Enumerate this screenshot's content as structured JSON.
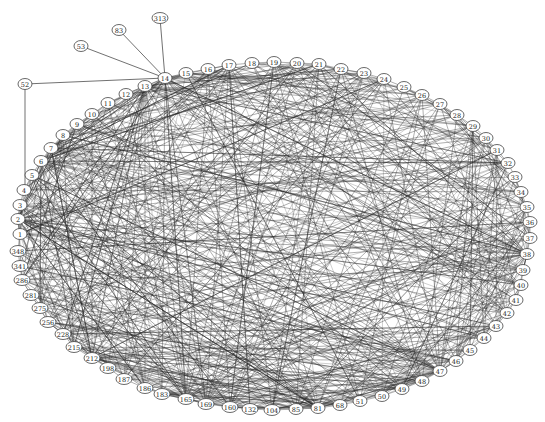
{
  "diagram": {
    "type": "network-graph",
    "layout": "circular-ellipse",
    "node_color": "#ffffff",
    "edge_color": "#2a2a2a",
    "nodes": [
      {
        "id": "1",
        "x": 20,
        "y": 234
      },
      {
        "id": "2",
        "x": 18,
        "y": 219
      },
      {
        "id": "3",
        "x": 20,
        "y": 205
      },
      {
        "id": "4",
        "x": 24,
        "y": 190
      },
      {
        "id": "5",
        "x": 32,
        "y": 175
      },
      {
        "id": "6",
        "x": 41,
        "y": 161
      },
      {
        "id": "7",
        "x": 51,
        "y": 148
      },
      {
        "id": "8",
        "x": 63,
        "y": 135
      },
      {
        "id": "9",
        "x": 77,
        "y": 124
      },
      {
        "id": "10",
        "x": 92,
        "y": 114
      },
      {
        "id": "11",
        "x": 108,
        "y": 103
      },
      {
        "id": "12",
        "x": 126,
        "y": 94
      },
      {
        "id": "13",
        "x": 145,
        "y": 86
      },
      {
        "id": "14",
        "x": 165,
        "y": 78
      },
      {
        "id": "15",
        "x": 186,
        "y": 73
      },
      {
        "id": "16",
        "x": 208,
        "y": 69
      },
      {
        "id": "17",
        "x": 229,
        "y": 65
      },
      {
        "id": "18",
        "x": 252,
        "y": 63
      },
      {
        "id": "19",
        "x": 274,
        "y": 62
      },
      {
        "id": "20",
        "x": 297,
        "y": 63
      },
      {
        "id": "21",
        "x": 319,
        "y": 64
      },
      {
        "id": "22",
        "x": 341,
        "y": 69
      },
      {
        "id": "23",
        "x": 364,
        "y": 73
      },
      {
        "id": "24",
        "x": 384,
        "y": 79
      },
      {
        "id": "25",
        "x": 404,
        "y": 87
      },
      {
        "id": "26",
        "x": 422,
        "y": 95
      },
      {
        "id": "27",
        "x": 440,
        "y": 104
      },
      {
        "id": "28",
        "x": 457,
        "y": 115
      },
      {
        "id": "29",
        "x": 473,
        "y": 126
      },
      {
        "id": "30",
        "x": 486,
        "y": 138
      },
      {
        "id": "31",
        "x": 497,
        "y": 150
      },
      {
        "id": "32",
        "x": 508,
        "y": 163
      },
      {
        "id": "33",
        "x": 515,
        "y": 177
      },
      {
        "id": "34",
        "x": 521,
        "y": 192
      },
      {
        "id": "35",
        "x": 527,
        "y": 207
      },
      {
        "id": "36",
        "x": 530,
        "y": 222
      },
      {
        "id": "37",
        "x": 530,
        "y": 238
      },
      {
        "id": "38",
        "x": 527,
        "y": 254
      },
      {
        "id": "39",
        "x": 523,
        "y": 270
      },
      {
        "id": "40",
        "x": 521,
        "y": 285
      },
      {
        "id": "41",
        "x": 516,
        "y": 300
      },
      {
        "id": "42",
        "x": 507,
        "y": 313
      },
      {
        "id": "43",
        "x": 496,
        "y": 326
      },
      {
        "id": "44",
        "x": 484,
        "y": 338
      },
      {
        "id": "45",
        "x": 470,
        "y": 350
      },
      {
        "id": "46",
        "x": 456,
        "y": 361
      },
      {
        "id": "47",
        "x": 440,
        "y": 371
      },
      {
        "id": "48",
        "x": 422,
        "y": 381
      },
      {
        "id": "49",
        "x": 402,
        "y": 389
      },
      {
        "id": "50",
        "x": 382,
        "y": 396
      },
      {
        "id": "51",
        "x": 360,
        "y": 401
      },
      {
        "id": "68",
        "x": 340,
        "y": 405
      },
      {
        "id": "81",
        "x": 318,
        "y": 408
      },
      {
        "id": "85",
        "x": 296,
        "y": 409
      },
      {
        "id": "104",
        "x": 272,
        "y": 410
      },
      {
        "id": "132",
        "x": 250,
        "y": 409
      },
      {
        "id": "160",
        "x": 230,
        "y": 407
      },
      {
        "id": "169",
        "x": 206,
        "y": 404
      },
      {
        "id": "165",
        "x": 186,
        "y": 399
      },
      {
        "id": "183",
        "x": 162,
        "y": 394
      },
      {
        "id": "186",
        "x": 145,
        "y": 388
      },
      {
        "id": "187",
        "x": 124,
        "y": 379
      },
      {
        "id": "198",
        "x": 108,
        "y": 368
      },
      {
        "id": "212",
        "x": 92,
        "y": 358
      },
      {
        "id": "215",
        "x": 74,
        "y": 347
      },
      {
        "id": "228",
        "x": 63,
        "y": 334
      },
      {
        "id": "256",
        "x": 48,
        "y": 322
      },
      {
        "id": "275",
        "x": 40,
        "y": 308
      },
      {
        "id": "281",
        "x": 31,
        "y": 295
      },
      {
        "id": "286",
        "x": 22,
        "y": 280
      },
      {
        "id": "341",
        "x": 20,
        "y": 266
      },
      {
        "id": "348",
        "x": 18,
        "y": 251
      },
      {
        "id": "52",
        "x": 25,
        "y": 84
      },
      {
        "id": "53",
        "x": 81,
        "y": 46
      },
      {
        "id": "83",
        "x": 119,
        "y": 30
      },
      {
        "id": "313",
        "x": 160,
        "y": 18
      }
    ],
    "external_edges": [
      [
        "52",
        "14"
      ],
      [
        "53",
        "14"
      ],
      [
        "83",
        "14"
      ],
      [
        "313",
        "14"
      ],
      [
        "52",
        "4"
      ]
    ],
    "hubs": [
      "2",
      "6",
      "7",
      "13",
      "14",
      "47",
      "38",
      "212",
      "165",
      "81"
    ]
  }
}
